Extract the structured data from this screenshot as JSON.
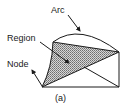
{
  "figure": {
    "caption": "(a)",
    "labels": {
      "arc": "Arc",
      "region": "Region",
      "node": "Node"
    },
    "colors": {
      "stroke": "#1a1a1a",
      "shade": "#9a9a9a",
      "background": "#ffffff"
    }
  }
}
